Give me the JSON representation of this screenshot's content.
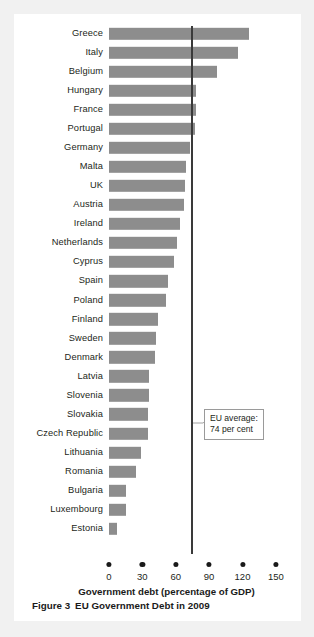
{
  "figure": {
    "caption_label": "Figure 3",
    "caption_title": "EU Government Debt in 2009"
  },
  "annotation": {
    "line1": "EU average:",
    "line2": "74 per cent",
    "value": 74
  },
  "colors": {
    "bar": "#8d8d8d",
    "refline": "#3a3a3a",
    "card": "#ffffff",
    "page": "#f1f1f1",
    "text": "#231f20"
  },
  "chart_data": {
    "type": "bar",
    "orientation": "horizontal",
    "xlabel": "Government debt (percentage of GDP)",
    "ylabel": "",
    "xlim": [
      0,
      160
    ],
    "xticks": [
      0,
      30,
      60,
      90,
      120,
      150
    ],
    "grid": false,
    "legend": false,
    "reference_line": {
      "value": 74,
      "label": "EU average: 74 per cent"
    },
    "categories": [
      "Greece",
      "Italy",
      "Belgium",
      "Hungary",
      "France",
      "Portugal",
      "Germany",
      "Malta",
      "UK",
      "Austria",
      "Ireland",
      "Netherlands",
      "Cyprus",
      "Spain",
      "Poland",
      "Finland",
      "Sweden",
      "Denmark",
      "Latvia",
      "Slovenia",
      "Slovakia",
      "Czech Republic",
      "Lithuania",
      "Romania",
      "Bulgaria",
      "Luxembourg",
      "Estonia"
    ],
    "values": [
      126,
      116,
      97,
      78,
      78,
      77,
      73,
      69,
      68,
      67,
      64,
      61,
      58,
      53,
      51,
      44,
      42,
      41,
      36,
      36,
      35,
      35,
      29,
      24,
      15,
      15,
      7
    ],
    "units": "percentage of GDP"
  }
}
